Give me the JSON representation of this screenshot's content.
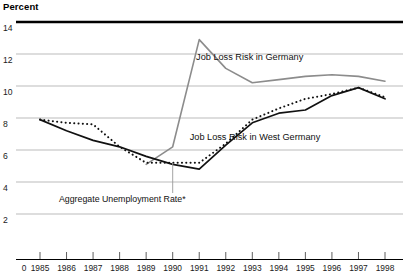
{
  "chart_data": {
    "type": "line",
    "title": "",
    "ylabel": "Percent",
    "xlabel": "",
    "ylim": [
      0,
      14
    ],
    "xlim": [
      1984.4,
      1998.6
    ],
    "grid": true,
    "gridlines_y": [
      2,
      4,
      6,
      8,
      10,
      12,
      14
    ],
    "legend": "inline-labels",
    "ytick_labels": [
      "14",
      "12",
      "10",
      "8",
      "6",
      "4",
      "2"
    ],
    "xtick_labels": [
      "0",
      "1985",
      "1986",
      "1987",
      "1988",
      "1989",
      "1990",
      "1991",
      "1992",
      "1993",
      "1994",
      "1995",
      "1996",
      "1997",
      "1998"
    ],
    "x": [
      1985,
      1986,
      1987,
      1988,
      1989,
      1990,
      1991,
      1992,
      1993,
      1994,
      1995,
      1996,
      1997,
      1998
    ],
    "series": [
      {
        "name": "Job Loss Risk in Germany",
        "style": "solid",
        "color": "#8c8c8c",
        "width": 1.6,
        "x": [
          1989,
          1990,
          1991,
          1992,
          1993,
          1994,
          1995,
          1996,
          1997,
          1998
        ],
        "values": [
          5.1,
          6.2,
          12.9,
          11.1,
          10.2,
          10.4,
          10.6,
          10.7,
          10.6,
          10.3
        ]
      },
      {
        "name": "Job Loss Risk in West Germany",
        "style": "dotted",
        "color": "#111111",
        "width": 2.0,
        "x": [
          1985,
          1986,
          1987,
          1988,
          1989,
          1990,
          1991,
          1992,
          1993,
          1994,
          1995,
          1996,
          1997,
          1998
        ],
        "values": [
          7.9,
          7.7,
          7.6,
          6.2,
          5.2,
          5.2,
          5.2,
          6.4,
          7.9,
          8.6,
          9.2,
          9.5,
          9.9,
          9.3
        ]
      },
      {
        "name": "Aggregate Unemployment Rate*",
        "style": "solid",
        "color": "#111111",
        "width": 1.7,
        "x": [
          1985,
          1986,
          1987,
          1988,
          1989,
          1990,
          1991,
          1992,
          1993,
          1994,
          1995,
          1996,
          1997,
          1998
        ],
        "values": [
          7.9,
          7.2,
          6.6,
          6.2,
          5.6,
          5.1,
          4.8,
          6.3,
          7.7,
          8.3,
          8.5,
          9.4,
          9.9,
          9.2
        ]
      }
    ],
    "annotations": [
      {
        "text": "Job Loss Risk in Germany",
        "x": 1992.9,
        "y": 11.6
      },
      {
        "text": "Job Loss Risk in West Germany",
        "x": 1993.1,
        "y": 6.6
      },
      {
        "text": "Aggregate Unemployment Rate*",
        "x": 1988.1,
        "y": 2.75,
        "leader_to_x": 1990.0,
        "leader_to_y": 5.2
      }
    ]
  }
}
